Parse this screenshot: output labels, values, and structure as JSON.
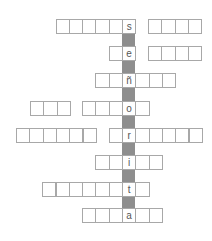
{
  "puzzle": {
    "title": "",
    "keyword": "señorita",
    "cell_width": 13.3,
    "cell_height": 14.3,
    "key_column_x": 122,
    "colors": {
      "cell_border": "#a8a8a8",
      "cell_bg": "#ffffff",
      "connector": "#8e8e8e",
      "letter": "#555555"
    },
    "rows": [
      {
        "y": 19,
        "letter": "s",
        "groups": [
          {
            "start_x": 55.5,
            "cells": 5,
            "key_index": 5,
            "total": 6
          },
          {
            "start_x": 148,
            "cells": 4,
            "key_index": -1,
            "total": 4
          }
        ]
      },
      {
        "y": 46,
        "letter": "e",
        "groups": [
          {
            "start_x": 108.7,
            "key_index": 1,
            "total": 2
          },
          {
            "start_x": 148,
            "key_index": -1,
            "total": 4
          }
        ]
      },
      {
        "y": 73,
        "letter": "ñ",
        "groups": [
          {
            "start_x": 95.4,
            "key_index": 2,
            "total": 6
          }
        ]
      },
      {
        "y": 101,
        "letter": "o",
        "groups": [
          {
            "start_x": 30,
            "key_index": -1,
            "total": 3
          },
          {
            "start_x": 82.1,
            "key_index": 3,
            "total": 5
          }
        ]
      },
      {
        "y": 128,
        "letter": "r",
        "groups": [
          {
            "start_x": 16,
            "key_index": -1,
            "total": 6
          },
          {
            "start_x": 108.7,
            "key_index": 1,
            "total": 7
          }
        ]
      },
      {
        "y": 155,
        "letter": "i",
        "groups": [
          {
            "start_x": 95.4,
            "key_index": 2,
            "total": 5
          }
        ]
      },
      {
        "y": 182,
        "letter": "t",
        "groups": [
          {
            "start_x": 42.2,
            "key_index": 6,
            "total": 8
          }
        ]
      },
      {
        "y": 208,
        "letter": "a",
        "groups": [
          {
            "start_x": 82.1,
            "key_index": 3,
            "total": 6
          }
        ]
      }
    ]
  }
}
